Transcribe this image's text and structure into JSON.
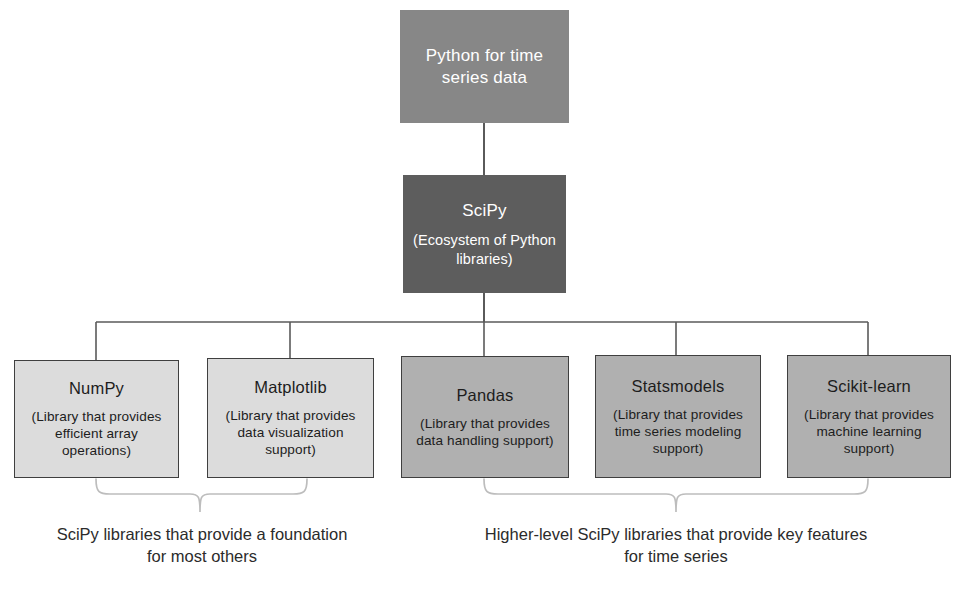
{
  "diagram": {
    "title": "Python for time series data",
    "root": {
      "label": "Python for time series data",
      "fill": "#878787",
      "text_color": "#ffffff"
    },
    "hub": {
      "label": "SciPy",
      "sublabel": "(Ecosystem of Python libraries)",
      "fill": "#5d5d5d",
      "text_color": "#ffffff"
    },
    "libraries": [
      {
        "name": "NumPy",
        "description": "(Library that provides efficient array operations)",
        "fill": "#dcdcdc",
        "group": "foundation"
      },
      {
        "name": "Matplotlib",
        "description": "(Library that provides data visualization support)",
        "fill": "#dcdcdc",
        "group": "foundation"
      },
      {
        "name": "Pandas",
        "description": "(Library that provides data handling support)",
        "fill": "#b0b0b0",
        "group": "higher-level"
      },
      {
        "name": "Statsmodels",
        "description": "(Library that provides time series modeling support)",
        "fill": "#b0b0b0",
        "group": "higher-level"
      },
      {
        "name": "Scikit-learn",
        "description": "(Library that provides machine learning support)",
        "fill": "#b0b0b0",
        "group": "higher-level"
      }
    ],
    "captions": {
      "left": "SciPy libraries that provide a foundation for most others",
      "right": "Higher-level SciPy libraries that provide key features for time series"
    },
    "colors": {
      "background": "#ffffff",
      "edge": "#5a5a5a",
      "brace": "#bdbdbd",
      "border": "#3f3f3f"
    }
  }
}
